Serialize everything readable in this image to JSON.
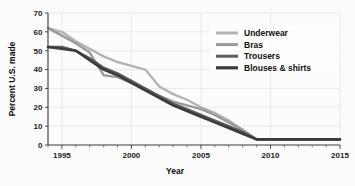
{
  "chart_data": {
    "type": "line",
    "title": "",
    "xlabel": "Year",
    "ylabel": "Percent U.S. made",
    "xlim": [
      1994,
      2015
    ],
    "ylim": [
      0,
      70
    ],
    "ytick_labels": [
      "0",
      "10",
      "20",
      "30",
      "40",
      "50",
      "60",
      "70"
    ],
    "ytick_values": [
      0,
      10,
      20,
      30,
      40,
      50,
      60,
      70
    ],
    "xtick_labels": [
      "1995",
      "2000",
      "2005",
      "2010",
      "2015"
    ],
    "xtick_values": [
      1995,
      2000,
      2005,
      2010,
      2015
    ],
    "minor_xticks": [
      1994,
      1996,
      1997,
      1998,
      1999,
      2001,
      2002,
      2003,
      2004,
      2006,
      2007,
      2008,
      2009,
      2011,
      2012,
      2013,
      2014
    ],
    "grid": true,
    "legend_position": "top-right",
    "x": [
      1994,
      1995,
      1996,
      1997,
      1998,
      1999,
      2000,
      2001,
      2002,
      2003,
      2004,
      2005,
      2006,
      2007,
      2008,
      2009,
      2010,
      2011,
      2012,
      2013,
      2014,
      2015
    ],
    "series": [
      {
        "name": "Underwear",
        "color": "#b4b4b4",
        "values": [
          62,
          60,
          55,
          51,
          47,
          44,
          42,
          40,
          31,
          27,
          24,
          20,
          17,
          13,
          8,
          3,
          3,
          3,
          3,
          3,
          3,
          3
        ]
      },
      {
        "name": "Bras",
        "color": "#9a9a9a",
        "values": [
          62,
          58,
          54,
          49,
          37,
          36,
          33,
          30,
          26,
          23,
          21,
          19,
          16,
          12,
          8,
          3,
          3,
          3,
          3,
          3,
          3,
          3
        ]
      },
      {
        "name": "Trousers",
        "color": "#5d5d5d",
        "values": [
          52,
          52,
          50,
          46,
          41,
          38,
          34,
          30,
          26,
          22,
          19,
          16,
          13,
          10,
          7,
          3,
          3,
          3,
          3,
          3,
          3,
          3
        ]
      },
      {
        "name": "Blouses & shirts",
        "color": "#3b3b3b",
        "values": [
          52,
          51,
          50,
          45,
          40,
          37,
          33,
          29,
          25,
          21,
          18,
          15,
          12,
          9,
          6,
          3,
          3,
          3,
          3,
          3,
          3,
          3
        ]
      }
    ]
  },
  "legend": {
    "entries": [
      {
        "label": "Underwear"
      },
      {
        "label": "Bras"
      },
      {
        "label": "Trousers"
      },
      {
        "label": "Blouses & shirts"
      }
    ]
  }
}
